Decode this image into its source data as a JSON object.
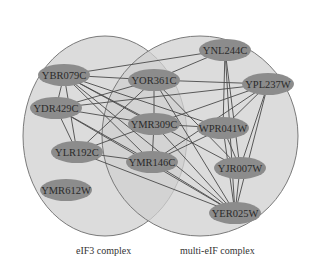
{
  "complexes": [
    {
      "id": "eIF3",
      "label": "eIF3 complex",
      "cx": 105,
      "cy": 136,
      "rx": 82,
      "ry": 100
    },
    {
      "id": "multi-eIF",
      "label": "multi-eIF complex",
      "cx": 200,
      "cy": 136,
      "rx": 98,
      "ry": 100
    }
  ],
  "nodes": [
    {
      "id": "YBR079C",
      "label": "YBR079C",
      "x": 64,
      "y": 75
    },
    {
      "id": "YOR361C",
      "label": "YOR361C",
      "x": 154,
      "y": 80
    },
    {
      "id": "YNL244C",
      "label": "YNL244C",
      "x": 225,
      "y": 50
    },
    {
      "id": "YPL237W",
      "label": "YPL237W",
      "x": 268,
      "y": 84
    },
    {
      "id": "YDR429C",
      "label": "YDR429C",
      "x": 56,
      "y": 108
    },
    {
      "id": "YMR309C",
      "label": "YMR309C",
      "x": 154,
      "y": 124
    },
    {
      "id": "WPR041W",
      "label": "WPR041W",
      "x": 223,
      "y": 128
    },
    {
      "id": "YLR192C",
      "label": "YLR192C",
      "x": 77,
      "y": 152
    },
    {
      "id": "YMR146C",
      "label": "YMR146C",
      "x": 152,
      "y": 162
    },
    {
      "id": "YJR007W",
      "label": "YJR007W",
      "x": 240,
      "y": 168
    },
    {
      "id": "YMR612W",
      "label": "YMR612W",
      "x": 66,
      "y": 190
    },
    {
      "id": "YER025W",
      "label": "YER025W",
      "x": 235,
      "y": 213
    }
  ],
  "edges": [
    [
      "YBR079C",
      "YOR361C"
    ],
    [
      "YBR079C",
      "YNL244C"
    ],
    [
      "YBR079C",
      "YDR429C"
    ],
    [
      "YBR079C",
      "YMR309C"
    ],
    [
      "YBR079C",
      "YLR192C"
    ],
    [
      "YBR079C",
      "YMR146C"
    ],
    [
      "YBR079C",
      "WPR041W"
    ],
    [
      "YBR079C",
      "YJR007W"
    ],
    [
      "YBR079C",
      "YER025W"
    ],
    [
      "YDR429C",
      "YOR361C"
    ],
    [
      "YDR429C",
      "YMR309C"
    ],
    [
      "YDR429C",
      "YLR192C"
    ],
    [
      "YDR429C",
      "YMR146C"
    ],
    [
      "YDR429C",
      "YER025W"
    ],
    [
      "YDR429C",
      "YPL237W"
    ],
    [
      "YLR192C",
      "YOR361C"
    ],
    [
      "YLR192C",
      "YMR309C"
    ],
    [
      "YLR192C",
      "YMR146C"
    ],
    [
      "YLR192C",
      "YER025W"
    ],
    [
      "YOR361C",
      "YPL237W"
    ],
    [
      "YOR361C",
      "YMR309C"
    ],
    [
      "YOR361C",
      "YER025W"
    ],
    [
      "YOR361C",
      "YJR007W"
    ],
    [
      "YOR361C",
      "YNL244C"
    ],
    [
      "YMR309C",
      "YMR146C"
    ],
    [
      "YMR309C",
      "YPL237W"
    ],
    [
      "YMR309C",
      "WPR041W"
    ],
    [
      "YMR309C",
      "YER025W"
    ],
    [
      "YMR146C",
      "YPL237W"
    ],
    [
      "YMR146C",
      "YER025W"
    ],
    [
      "YMR146C",
      "WPR041W"
    ],
    [
      "YNL244C",
      "WPR041W"
    ],
    [
      "YNL244C",
      "YER025W"
    ],
    [
      "YNL244C",
      "YJR007W"
    ],
    [
      "YPL237W",
      "WPR041W"
    ],
    [
      "YPL237W",
      "YER025W"
    ],
    [
      "YPL237W",
      "YJR007W"
    ],
    [
      "WPR041W",
      "YER025W"
    ],
    [
      "WPR041W",
      "YJR007W"
    ],
    [
      "YJR007W",
      "YER025W"
    ]
  ],
  "colors": {
    "complex_fill": "#d0d0d0",
    "node_fill": "#8c8c8c",
    "edge": "#4a4a4a",
    "text": "#2a2a2a"
  }
}
